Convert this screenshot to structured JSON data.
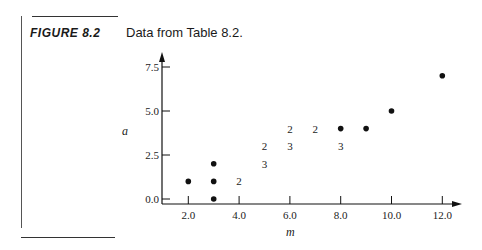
{
  "figure": {
    "label": "FIGURE 8.2",
    "caption": "Data from Table 8.2."
  },
  "chart_data": {
    "type": "scatter",
    "title": "Data from Table 8.2.",
    "xlabel": "m",
    "ylabel": "a",
    "xlim": [
      1.0,
      13.0
    ],
    "ylim": [
      -0.3,
      8.0
    ],
    "x_ticks": [
      2.0,
      4.0,
      6.0,
      8.0,
      10.0,
      12.0
    ],
    "x_tick_labels": [
      "2.0",
      "4.0",
      "6.0",
      "8.0",
      "10.0",
      "12.0"
    ],
    "y_ticks": [
      0.0,
      2.5,
      5.0,
      7.5
    ],
    "y_tick_labels": [
      "0.0",
      "2.5",
      "5.0",
      "7.5"
    ],
    "grid": false,
    "legend": "none",
    "annotation_note": "Numerals mark points with multiple overlapping observations (count shown); dots mark single observations.",
    "points": [
      {
        "x": 2,
        "y": 1,
        "count": 1
      },
      {
        "x": 3,
        "y": 0,
        "count": 1
      },
      {
        "x": 3,
        "y": 1,
        "count": 1
      },
      {
        "x": 3,
        "y": 2,
        "count": 1
      },
      {
        "x": 4,
        "y": 1,
        "count": 2
      },
      {
        "x": 5,
        "y": 2,
        "count": 3
      },
      {
        "x": 5,
        "y": 3,
        "count": 2
      },
      {
        "x": 6,
        "y": 3,
        "count": 3
      },
      {
        "x": 6,
        "y": 4,
        "count": 2
      },
      {
        "x": 7,
        "y": 4,
        "count": 2
      },
      {
        "x": 8,
        "y": 3,
        "count": 3
      },
      {
        "x": 8,
        "y": 4,
        "count": 1
      },
      {
        "x": 9,
        "y": 4,
        "count": 1
      },
      {
        "x": 10,
        "y": 5,
        "count": 1
      },
      {
        "x": 12,
        "y": 7,
        "count": 1
      }
    ]
  }
}
